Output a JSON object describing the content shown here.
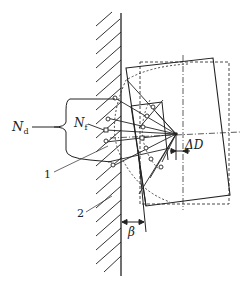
{
  "diagram": {
    "type": "mechanics-schematic",
    "labels": {
      "n_d": "N",
      "n_d_sub": "d",
      "n_f": "N",
      "n_f_sub": "f",
      "callout_1": "1",
      "callout_2": "2",
      "delta_d": "ΔD",
      "beta": "β"
    },
    "colors": {
      "line": "#222222",
      "background": "#ffffff"
    }
  }
}
